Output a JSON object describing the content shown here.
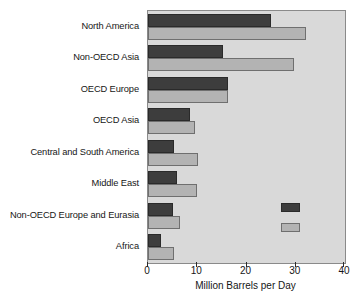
{
  "chart_data": {
    "type": "bar",
    "orientation": "horizontal",
    "title": "",
    "xlabel": "Million Barrels per Day",
    "ylabel": "",
    "xlim": [
      0,
      40
    ],
    "xticks": [
      0,
      10,
      20,
      30,
      40
    ],
    "xticklabels": [
      "0",
      "10",
      "20",
      "30",
      "40"
    ],
    "grid": false,
    "legend_position": "inside-right",
    "categories": [
      "North America",
      "Non-OECD Asia",
      "OECD Europe",
      "OECD Asia",
      "Central and South America",
      "Middle East",
      "Non-OECD Europe and Eurasia",
      "Africa"
    ],
    "series": [
      {
        "name": "",
        "swatch": "dark",
        "color": "#3d3d3d",
        "values": [
          25.0,
          15.2,
          16.2,
          8.6,
          5.3,
          5.8,
          5.0,
          2.6
        ]
      },
      {
        "name": "",
        "swatch": "light",
        "color": "#b3b3b3",
        "values": [
          32.0,
          29.7,
          16.2,
          9.6,
          10.2,
          10.0,
          6.5,
          5.2
        ]
      }
    ],
    "legend_entries": [
      {
        "label": "",
        "color": "#3d3d3d"
      },
      {
        "label": "",
        "color": "#b3b3b3"
      }
    ],
    "colors": {
      "dark_series": "#3d3d3d",
      "light_series": "#b3b3b3",
      "plot_background": "#d9d9d9",
      "axis": "#2b2b2b",
      "text": "#161616"
    }
  }
}
